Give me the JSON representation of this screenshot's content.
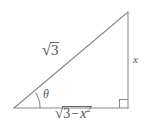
{
  "figure": {
    "kind": "right-triangle-trigonometry-diagram",
    "background_color": "#ffffff",
    "stroke_color": "#8a8a8a",
    "label_color": "#555555",
    "vertices": {
      "left": [
        14,
        108
      ],
      "top_right": [
        128,
        12
      ],
      "bottom_right": [
        128,
        108
      ]
    },
    "labels": {
      "hypotenuse": "√3",
      "hypotenuse_radicand": "3",
      "opposite_leg": "x",
      "adjacent_leg": "√(3 − x²)",
      "adjacent_radicand_base": "3",
      "adjacent_minus": "−",
      "adjacent_variable": "x",
      "adjacent_exponent": "2",
      "angle": "θ",
      "radical_sign": "√"
    },
    "markers": {
      "right_angle": "square",
      "right_angle_size_px": 8,
      "angle_arc_radius_px": 26
    }
  }
}
